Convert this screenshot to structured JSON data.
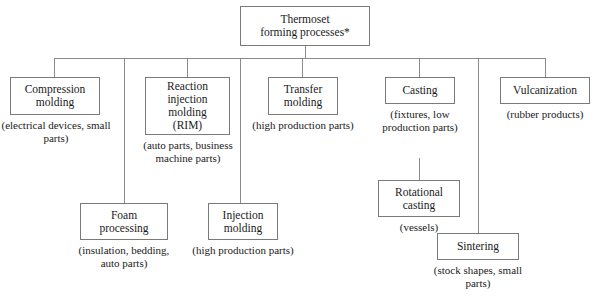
{
  "diagram": {
    "type": "hierarchy-tree",
    "line_color": "#8a8a8a",
    "box_border_color": "#7a7a7a",
    "background": "#ffffff",
    "root": {
      "label_line1": "Thermoset",
      "label_line2": "forming processes*"
    },
    "nodes": {
      "compression_molding": {
        "label_line1": "Compression",
        "label_line2": "molding",
        "caption_line1": "(electrical devices,",
        "caption_line2": "small parts)"
      },
      "reaction_injection_molding": {
        "label_line1": "Reaction",
        "label_line2": "injection",
        "label_line3": "molding",
        "label_line4": "(RIM)",
        "caption_line1": "(auto parts,",
        "caption_line2": "business machine",
        "caption_line3": "parts)"
      },
      "transfer_molding": {
        "label_line1": "Transfer",
        "label_line2": "molding",
        "caption_line1": "(high production",
        "caption_line2": "parts)"
      },
      "casting": {
        "label_line1": "Casting",
        "caption_line1": "(fixtures, low",
        "caption_line2": "production",
        "caption_line3": "parts)"
      },
      "vulcanization": {
        "label_line1": "Vulcanization",
        "caption_line1": "(rubber products)"
      },
      "foam_processing": {
        "label_line1": "Foam",
        "label_line2": "processing",
        "caption_line1": "(insulation,",
        "caption_line2": "bedding,",
        "caption_line3": "auto parts)"
      },
      "injection_molding": {
        "label_line1": "Injection",
        "label_line2": "molding",
        "caption_line1": "(high production",
        "caption_line2": "parts)"
      },
      "rotational_casting": {
        "label_line1": "Rotational",
        "label_line2": "casting",
        "caption_line1": "(vessels)"
      },
      "sintering": {
        "label_line1": "Sintering",
        "caption_line1": "(stock shapes,",
        "caption_line2": "small parts)"
      }
    }
  }
}
